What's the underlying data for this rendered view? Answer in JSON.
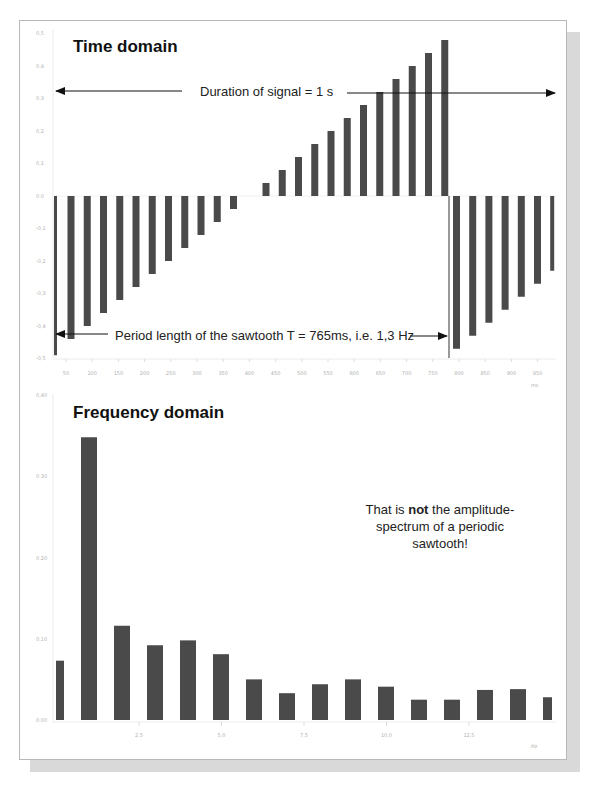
{
  "chart_data": [
    {
      "type": "bar",
      "title": "Time domain",
      "xlabel": "",
      "x_unit": "ms",
      "ylabel": "",
      "ylim": [
        -0.5,
        0.5
      ],
      "yticks": [
        "0,5",
        "0,4",
        "0,3",
        "0,2",
        "0,1",
        "0,0",
        "-0,1",
        "-0,2",
        "-0,3",
        "-0,4",
        "-0,5"
      ],
      "xticks": [
        "50",
        "100",
        "150",
        "200",
        "250",
        "300",
        "350",
        "400",
        "450",
        "500",
        "550",
        "600",
        "650",
        "700",
        "750",
        "800",
        "850",
        "900",
        "950"
      ],
      "grid": false,
      "values": [
        -0.49,
        -0.44,
        -0.4,
        -0.36,
        -0.32,
        -0.28,
        -0.24,
        -0.2,
        -0.16,
        -0.12,
        -0.08,
        -0.04,
        0.0,
        0.04,
        0.08,
        0.12,
        0.16,
        0.2,
        0.24,
        0.28,
        0.32,
        0.36,
        0.4,
        0.44,
        0.48,
        -0.47,
        -0.43,
        -0.39,
        -0.35,
        -0.31,
        -0.27,
        -0.23
      ],
      "annotations": [
        {
          "text": "Duration of signal = 1 s",
          "type": "double-arrow"
        },
        {
          "text": "Period length of the sawtooth T = 765ms, i.e. 1,3 Hz",
          "type": "double-arrow"
        }
      ]
    },
    {
      "type": "bar",
      "title": "Frequency domain",
      "xlabel": "",
      "x_unit": "Hz",
      "ylabel": "",
      "ylim": [
        0,
        0.4
      ],
      "yticks": [
        "0,40",
        "0,30",
        "0,20",
        "0,10",
        "0,00"
      ],
      "xticks": [
        "2,5",
        "5,0",
        "7,5",
        "10,0",
        "12,5"
      ],
      "grid": false,
      "values": [
        0.073,
        0.348,
        0.116,
        0.092,
        0.098,
        0.081,
        0.05,
        0.033,
        0.044,
        0.05,
        0.041,
        0.025,
        0.025,
        0.037,
        0.038,
        0.028
      ],
      "annotations": [
        {
          "text_parts": [
            "That is ",
            "not",
            " the amplitude-",
            "spectrum of a periodic",
            "sawtooth!"
          ]
        }
      ]
    }
  ],
  "time": {
    "title": "Time domain",
    "duration_label": "Duration of signal = 1 s",
    "period_label": "Period length of the sawtooth T = 765ms, i.e. 1,3 Hz",
    "x_unit": "ms"
  },
  "freq": {
    "title": "Frequency domain",
    "note_line1_a": "That is ",
    "note_line1_bold": "not",
    "note_line1_b": " the amplitude-",
    "note_line2": "spectrum of a periodic",
    "note_line3": "sawtooth!",
    "x_unit": "Hz"
  },
  "colors": {
    "bar": "#4a4a4a",
    "axis": "#e6e6e6",
    "tick_text": "#b0b0b0",
    "arrow": "#111111",
    "shadow": "#d9d9d9"
  }
}
